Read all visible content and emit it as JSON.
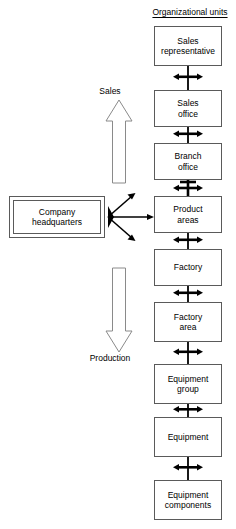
{
  "diagram": {
    "title": "Organizational units",
    "headquarters": {
      "label": "Company headquarters",
      "line1": "Company",
      "line2": "headquarters"
    },
    "flows": [
      {
        "name": "sales",
        "label": "Sales",
        "direction": "up"
      },
      {
        "name": "production",
        "label": "Production",
        "direction": "down"
      }
    ],
    "units": [
      {
        "id": "sales-representative",
        "line1": "Sales",
        "line2": "representative"
      },
      {
        "id": "sales-office",
        "line1": "Sales",
        "line2": "office"
      },
      {
        "id": "branch-office",
        "line1": "Branch",
        "line2": "office"
      },
      {
        "id": "product-areas",
        "line1": "Product",
        "line2": "areas"
      },
      {
        "id": "factory",
        "line1": "Factory",
        "line2": ""
      },
      {
        "id": "factory-area",
        "line1": "Factory",
        "line2": "area"
      },
      {
        "id": "equipment-group",
        "line1": "Equipment",
        "line2": "group"
      },
      {
        "id": "equipment",
        "line1": "Equipment",
        "line2": ""
      },
      {
        "id": "equipment-components",
        "line1": "Equipment",
        "line2": "components"
      }
    ],
    "colors": {
      "box_border": "#5a5a5a",
      "connector": "#000000",
      "background": "#ffffff",
      "text": "#000000"
    }
  }
}
